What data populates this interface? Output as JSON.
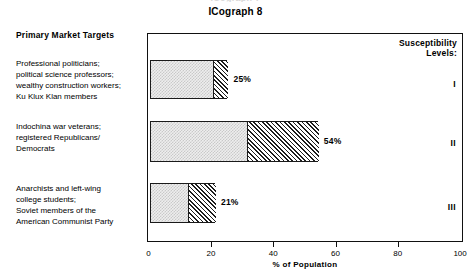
{
  "ghost_text": "ICograph 7",
  "title": "ICograph 8",
  "left_panel": {
    "heading": "Primary Market Targets",
    "groups": [
      "Professional politicians;\npolitical science professors;\nwealthy construction workers;\nKu Klux Klan members",
      "Indochina war veterans;\nregistered Republicans/\nDemocrats",
      "Anarchists and left-wing\ncollege students;\nSoviet members of the\nAmerican Communist Party"
    ]
  },
  "legend": {
    "heading_line1": "Susceptibility",
    "heading_line2": "Levels:",
    "levels": [
      "I",
      "II",
      "III"
    ]
  },
  "chart_data": {
    "type": "bar",
    "orientation": "horizontal",
    "title": "ICograph 8",
    "xlabel": "% of Population",
    "ylabel": "Primary Market Targets",
    "xlim": [
      0,
      100
    ],
    "xticks": [
      0,
      20,
      40,
      60,
      80,
      100
    ],
    "xtick_labels": [
      "0",
      "20",
      "40",
      "60",
      "80",
      "100"
    ],
    "grid": false,
    "legend_position": "inside-top-right",
    "categories": [
      "Professional politicians; political science professors; wealthy construction workers; Ku Klux Klan members",
      "Indochina war veterans; registered Republicans/Democrats",
      "Anarchists and left-wing college students; Soviet members of the American Communist Party"
    ],
    "series": [
      {
        "name": "base (stipple fill)",
        "fill": "stipple-light-gray",
        "values": [
          20,
          31,
          12
        ]
      },
      {
        "name": "extension (diagonal hatch)",
        "fill": "diagonal-hatch",
        "values": [
          5,
          23,
          9
        ]
      }
    ],
    "values": [
      25,
      54,
      21
    ],
    "value_labels": [
      "25%",
      "54%",
      "21%"
    ],
    "level_labels": [
      "I",
      "II",
      "III"
    ]
  },
  "colors": {
    "ink": "#111111",
    "stipple": "#c9c9c9",
    "hatch": "#1d1d1d",
    "background": "#ffffff"
  }
}
